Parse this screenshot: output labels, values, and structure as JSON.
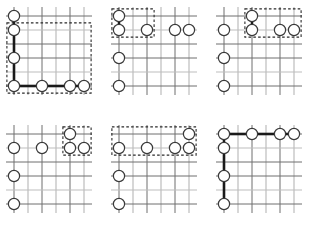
{
  "figure": {
    "background_color": "#ffffff",
    "width": 315,
    "height": 237,
    "colors": {
      "grid": "#6f6f6f",
      "grid_pale": "#bdbdbd",
      "chain_link": "#1a1a1a",
      "region_box": "#2a2a2a",
      "stone_fill": "#ffffff",
      "stone_stroke": "#3a3a3a"
    },
    "grid": {
      "columns": 6,
      "rows": 6,
      "spacing": 14,
      "origin_x": 14,
      "origin_y": 16
    },
    "stone_radius": 5.6
  },
  "panels": [
    {
      "id": "panel-1",
      "name": "panel-top-left",
      "x": 0,
      "y": 0,
      "stones": [
        {
          "col": 0,
          "row": 0
        },
        {
          "col": 0,
          "row": 1
        },
        {
          "col": 0,
          "row": 3
        },
        {
          "col": 0,
          "row": 5
        },
        {
          "col": 2,
          "row": 5
        },
        {
          "col": 4,
          "row": 5
        },
        {
          "col": 5,
          "row": 5
        }
      ],
      "links": [
        {
          "from": [
            0,
            0
          ],
          "to": [
            0,
            1
          ]
        },
        {
          "from": [
            0,
            1
          ],
          "to": [
            0,
            3
          ]
        },
        {
          "from": [
            0,
            3
          ],
          "to": [
            0,
            5
          ]
        },
        {
          "from": [
            0,
            5
          ],
          "to": [
            2,
            5
          ]
        },
        {
          "from": [
            2,
            5
          ],
          "to": [
            4,
            5
          ]
        },
        {
          "from": [
            4,
            5
          ],
          "to": [
            5,
            5
          ]
        }
      ],
      "region_boxes": [
        {
          "col0": 0,
          "row0": 1,
          "col1": 5,
          "row1": 5
        }
      ],
      "pale_columns": [
        1,
        3,
        5
      ],
      "pale_rows": [
        1,
        4
      ]
    },
    {
      "id": "panel-2",
      "name": "panel-top-center",
      "x": 105,
      "y": 0,
      "stones": [
        {
          "col": 0,
          "row": 0
        },
        {
          "col": 0,
          "row": 1
        },
        {
          "col": 0,
          "row": 3
        },
        {
          "col": 0,
          "row": 5
        },
        {
          "col": 2,
          "row": 1
        },
        {
          "col": 4,
          "row": 1
        },
        {
          "col": 5,
          "row": 1
        }
      ],
      "links": [
        {
          "from": [
            0,
            0
          ],
          "to": [
            0,
            1
          ]
        }
      ],
      "region_boxes": [
        {
          "col0": 0,
          "row0": 0,
          "col1": 2,
          "row1": 1
        }
      ],
      "pale_columns": [
        1,
        3,
        5
      ],
      "pale_rows": [
        1,
        4
      ]
    },
    {
      "id": "panel-3",
      "name": "panel-top-right",
      "x": 210,
      "y": 0,
      "stones": [
        {
          "col": 0,
          "row": 1
        },
        {
          "col": 0,
          "row": 3
        },
        {
          "col": 0,
          "row": 5
        },
        {
          "col": 2,
          "row": 0
        },
        {
          "col": 2,
          "row": 1
        },
        {
          "col": 4,
          "row": 1
        },
        {
          "col": 5,
          "row": 1
        }
      ],
      "links": [
        {
          "from": [
            2,
            0
          ],
          "to": [
            2,
            1
          ]
        }
      ],
      "region_boxes": [
        {
          "col0": 2,
          "row0": 0,
          "col1": 5,
          "row1": 1
        }
      ],
      "pale_columns": [
        1,
        3,
        5
      ],
      "pale_rows": [
        1,
        4
      ]
    },
    {
      "id": "panel-4",
      "name": "panel-bottom-left",
      "x": 0,
      "y": 118,
      "stones": [
        {
          "col": 0,
          "row": 1
        },
        {
          "col": 0,
          "row": 3
        },
        {
          "col": 0,
          "row": 5
        },
        {
          "col": 2,
          "row": 1
        },
        {
          "col": 4,
          "row": 0
        },
        {
          "col": 4,
          "row": 1
        },
        {
          "col": 5,
          "row": 1
        }
      ],
      "links": [],
      "region_boxes": [
        {
          "col0": 4,
          "row0": 0,
          "col1": 5,
          "row1": 1
        }
      ],
      "pale_columns": [
        1,
        3,
        5
      ],
      "pale_rows": [
        1,
        4
      ]
    },
    {
      "id": "panel-5",
      "name": "panel-bottom-center",
      "x": 105,
      "y": 118,
      "stones": [
        {
          "col": 0,
          "row": 1
        },
        {
          "col": 0,
          "row": 3
        },
        {
          "col": 0,
          "row": 5
        },
        {
          "col": 2,
          "row": 1
        },
        {
          "col": 4,
          "row": 1
        },
        {
          "col": 5,
          "row": 0
        },
        {
          "col": 5,
          "row": 1
        }
      ],
      "links": [],
      "region_boxes": [
        {
          "col0": 0,
          "row0": 0,
          "col1": 5,
          "row1": 1
        }
      ],
      "pale_columns": [
        1,
        3,
        5
      ],
      "pale_rows": [
        1,
        4
      ]
    },
    {
      "id": "panel-6",
      "name": "panel-bottom-right",
      "x": 210,
      "y": 118,
      "stones": [
        {
          "col": 0,
          "row": 0
        },
        {
          "col": 0,
          "row": 1
        },
        {
          "col": 0,
          "row": 3
        },
        {
          "col": 0,
          "row": 5
        },
        {
          "col": 2,
          "row": 0
        },
        {
          "col": 4,
          "row": 0
        },
        {
          "col": 5,
          "row": 0
        }
      ],
      "links": [
        {
          "from": [
            0,
            0
          ],
          "to": [
            2,
            0
          ]
        },
        {
          "from": [
            2,
            0
          ],
          "to": [
            4,
            0
          ]
        },
        {
          "from": [
            4,
            0
          ],
          "to": [
            5,
            0
          ]
        },
        {
          "from": [
            0,
            0
          ],
          "to": [
            0,
            1
          ]
        },
        {
          "from": [
            0,
            1
          ],
          "to": [
            0,
            3
          ]
        },
        {
          "from": [
            0,
            3
          ],
          "to": [
            0,
            5
          ]
        }
      ],
      "region_boxes": [],
      "pale_columns": [
        1,
        3,
        5
      ],
      "pale_rows": [
        1,
        4
      ]
    }
  ]
}
